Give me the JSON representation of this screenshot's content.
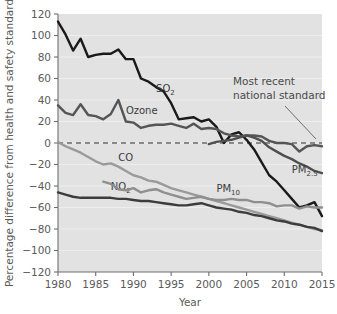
{
  "chart_data": {
    "type": "line",
    "title": "",
    "xlabel": "Year",
    "ylabel": "Percentage difference from health and safety standard",
    "xlim": [
      1980,
      2015
    ],
    "ylim": [
      -120,
      120
    ],
    "xticks": [
      1980,
      1985,
      1990,
      1995,
      2000,
      2005,
      2010,
      2015
    ],
    "yticks": [
      120,
      100,
      80,
      60,
      40,
      20,
      0,
      -20,
      -40,
      -60,
      -80,
      -100,
      -120
    ],
    "grid": "horizontal-faint",
    "legend": "inline-labels",
    "plot_background": "#e2e2e2",
    "reference_line": {
      "value": 0,
      "style": "dashed",
      "label": "Most recent national standard"
    },
    "annotations": [
      {
        "text_line1": "Most recent",
        "text_line2": "national standard",
        "points_to": {
          "x": 2015,
          "y": 0
        }
      }
    ],
    "x": [
      1980,
      1981,
      1982,
      1983,
      1984,
      1985,
      1986,
      1987,
      1988,
      1989,
      1990,
      1991,
      1992,
      1993,
      1994,
      1995,
      1996,
      1997,
      1998,
      1999,
      2000,
      2001,
      2002,
      2003,
      2004,
      2005,
      2006,
      2007,
      2008,
      2009,
      2010,
      2011,
      2012,
      2013,
      2014,
      2015
    ],
    "series": [
      {
        "name": "SO2",
        "label": "SO",
        "sub": "2",
        "color": "#1a1a1a",
        "label_x": 1993,
        "label_y": 47,
        "values": [
          113,
          101,
          86,
          97,
          80,
          82,
          83,
          83,
          87,
          78,
          78,
          60,
          57,
          52,
          48,
          37,
          22,
          23,
          24,
          20,
          22,
          15,
          0,
          8,
          10,
          3,
          -6,
          -18,
          -30,
          -36,
          -44,
          -52,
          -60,
          -58,
          -55,
          -68
        ]
      },
      {
        "name": "Ozone",
        "label": "Ozone",
        "sub": "",
        "color": "#555555",
        "label_x": 1989,
        "label_y": 27,
        "values": [
          35,
          28,
          26,
          36,
          26,
          25,
          22,
          27,
          40,
          20,
          19,
          14,
          16,
          17,
          17,
          18,
          16,
          14,
          18,
          13,
          14,
          13,
          9,
          7,
          6,
          7,
          7,
          6,
          2,
          0,
          0,
          -1,
          -8,
          -3,
          -2,
          -3
        ]
      },
      {
        "name": "CO",
        "label": "CO",
        "sub": "",
        "color": "#9a9a9a",
        "label_x": 1988,
        "label_y": -17,
        "values": [
          1,
          -3,
          -6,
          -9,
          -13,
          -17,
          -20,
          -19,
          -22,
          -26,
          -30,
          -32,
          -35,
          -36,
          -39,
          -42,
          -44,
          -46,
          -48,
          -50,
          -52,
          -54,
          -56,
          -58,
          -60,
          -62,
          -64,
          -66,
          -68,
          -70,
          -72,
          -74,
          -76,
          -78,
          -80,
          -81
        ]
      },
      {
        "name": "NO2",
        "label": "NO",
        "sub": "2",
        "color": "#3c3c3c",
        "label_x": 1987,
        "label_y": -44,
        "values": [
          -46,
          -48,
          -50,
          -51,
          -51,
          -51,
          -51,
          -51,
          -52,
          -52,
          -53,
          -54,
          -54,
          -55,
          -56,
          -57,
          -58,
          -58,
          -57,
          -56,
          -58,
          -60,
          -61,
          -62,
          -64,
          -65,
          -67,
          -68,
          -70,
          -72,
          -73,
          -75,
          -76,
          -78,
          -79,
          -82
        ]
      },
      {
        "name": "PM10",
        "label": "PM",
        "sub": "10",
        "color": "#8f8f8f",
        "label_x": 2001,
        "label_y": -46,
        "values": [
          null,
          null,
          null,
          null,
          null,
          null,
          -36,
          -38,
          -43,
          -44,
          -42,
          -46,
          -44,
          -43,
          -46,
          -48,
          -50,
          -52,
          -51,
          -50,
          -52,
          -53,
          -53,
          -52,
          -53,
          -53,
          -55,
          -55,
          -56,
          -59,
          -58,
          -58,
          -61,
          -59,
          -60,
          -60
        ]
      },
      {
        "name": "PM2.5",
        "label": "PM",
        "sub": "2.5",
        "color": "#4f4f4f",
        "label_x": 2011,
        "label_y": -28,
        "values": [
          null,
          null,
          null,
          null,
          null,
          null,
          null,
          null,
          null,
          null,
          null,
          null,
          null,
          null,
          null,
          null,
          null,
          null,
          null,
          null,
          -1,
          1,
          2,
          3,
          5,
          7,
          5,
          2,
          -4,
          -8,
          -12,
          -15,
          -19,
          -22,
          -26,
          -28
        ]
      }
    ]
  },
  "caption_partial": "",
  "axis": {
    "ylabel": "Percentage difference from health and safety standard",
    "xlabel": "Year"
  }
}
